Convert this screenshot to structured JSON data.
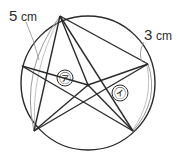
{
  "figure": {
    "background_color": "#ffffff",
    "stroke_color": "#2b2b2b",
    "arc_stroke_color": "#8d8d8d",
    "leader_stroke_color": "#9a9a9a"
  },
  "labels": {
    "arc_left": {
      "value": "5",
      "unit": "cm",
      "full": "5 cm"
    },
    "arc_right": {
      "value": "3",
      "unit": "cm",
      "full": "3 cm"
    }
  },
  "regions": [
    {
      "id": "region-a",
      "glyph": "㋐",
      "reading": "a",
      "position": "upper-left sector"
    },
    {
      "id": "region-i",
      "glyph": "㋑",
      "reading": "i",
      "position": "right sector"
    }
  ],
  "circle": {
    "center_x": 88,
    "center_y": 83,
    "radius": 67
  },
  "star_vertices": [
    {
      "name": "top",
      "x": 60,
      "y": 16
    },
    {
      "name": "right",
      "x": 148,
      "y": 64
    },
    {
      "name": "bottom-right",
      "x": 133,
      "y": 131
    },
    {
      "name": "bottom-left",
      "x": 34,
      "y": 131
    },
    {
      "name": "left",
      "x": 22,
      "y": 66
    }
  ],
  "hub": {
    "x": 88,
    "y": 85
  }
}
